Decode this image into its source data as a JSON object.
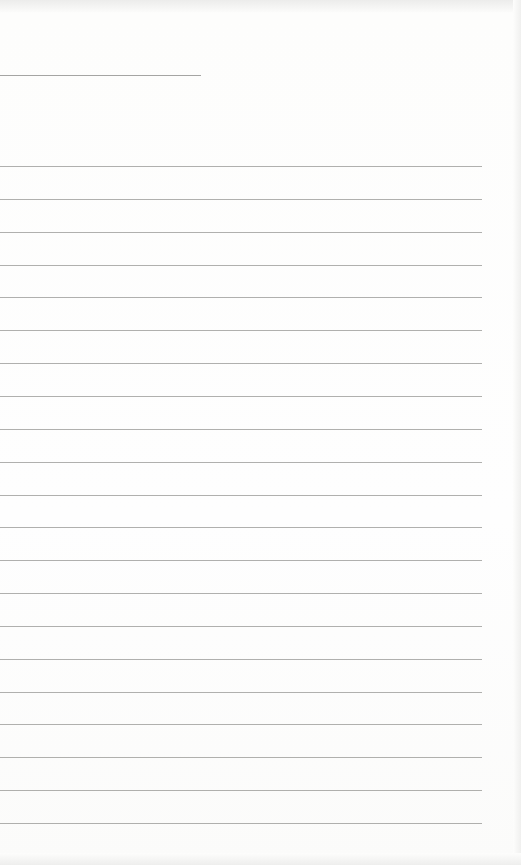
{
  "document": {
    "type": "blank lined paper",
    "header_rule": {
      "y": 75,
      "width": 201
    },
    "rules": {
      "first_y": 166,
      "spacing": 32.85,
      "count": 21,
      "width": 482
    },
    "colors": {
      "paper": "#fdfdfc",
      "rule": "#9c9c9a"
    }
  }
}
